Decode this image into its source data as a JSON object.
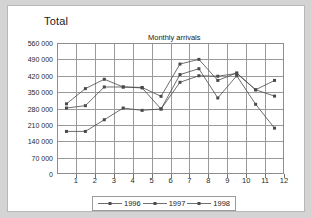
{
  "panel": {
    "corner_label": "Total"
  },
  "chart_data": {
    "type": "line",
    "title": "Monthly arrivals",
    "xlabel": "",
    "ylabel": "",
    "grid": true,
    "legend_position": "bottom",
    "categories": [
      "1",
      "2",
      "3",
      "4",
      "5",
      "6",
      "7",
      "8",
      "9",
      "10",
      "11",
      "12"
    ],
    "x_tick_labels": [
      "1",
      "2",
      "3",
      "4",
      "5",
      "6",
      "7",
      "8",
      "9",
      "10",
      "11",
      "12"
    ],
    "y_tick_labels": [
      "0",
      "70 000",
      "140 000",
      "210 000",
      "280 000",
      "350 000",
      "420 000",
      "490 000",
      "560 000"
    ],
    "y_tick_values": [
      0,
      70000,
      140000,
      210000,
      280000,
      350000,
      420000,
      490000,
      560000
    ],
    "ylim": [
      0,
      560000
    ],
    "xlim": [
      0,
      12
    ],
    "series": [
      {
        "name": "1996",
        "color": "#4a4a4a",
        "marker": "square",
        "values": [
          300000,
          365000,
          405000,
          372000,
          370000,
          332000,
          470000,
          490000,
          400000,
          432000,
          360000,
          400000
        ]
      },
      {
        "name": "1997",
        "color": "#4a4a4a",
        "marker": "square",
        "values": [
          282000,
          292000,
          372000,
          372000,
          368000,
          278000,
          392000,
          420000,
          418000,
          430000,
          360000,
          333000
        ]
      },
      {
        "name": "1998",
        "color": "#4a4a4a",
        "marker": "square",
        "values": [
          182000,
          182000,
          232000,
          282000,
          272000,
          278000,
          425000,
          450000,
          325000,
          420000,
          298000,
          196000
        ]
      }
    ]
  }
}
